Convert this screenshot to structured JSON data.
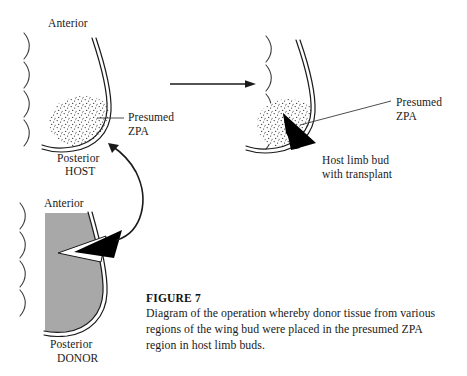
{
  "figure": {
    "number_label": "FIGURE 7",
    "caption": "Diagram of the operation whereby donor tissue from various regions of the wing bud were placed in the presumed ZPA region in host limb buds."
  },
  "panels": {
    "host_before": {
      "anterior_label": "Anterior",
      "posterior_label": "Posterior",
      "specimen_label": "HOST",
      "zpa_label_line1": "Presumed",
      "zpa_label_line2": "ZPA",
      "somite_count": 4
    },
    "host_after": {
      "zpa_label_line1": "Presumed",
      "zpa_label_line2": "ZPA",
      "caption_line1": "Host limb bud",
      "caption_line2": "with transplant",
      "somite_count": 4
    },
    "donor": {
      "anterior_label": "Anterior",
      "posterior_label": "Posterior",
      "specimen_label": "DONOR",
      "somite_count": 4
    }
  },
  "arrows": {
    "transformation_arrow": "horizontal-right-arrow",
    "graft_arrow": "curved-arrow-donor-to-host"
  },
  "colors": {
    "ink": "#1a1a1a",
    "donor_fill": "#a8a8a8",
    "transplant_fill": "#000000",
    "excised_fill": "#ffffff",
    "background": "#ffffff"
  }
}
